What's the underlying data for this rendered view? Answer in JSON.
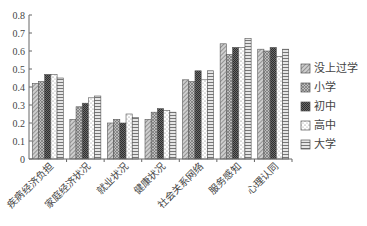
{
  "chart_data": {
    "type": "bar",
    "title": "",
    "xlabel": "",
    "ylabel": "",
    "ylim": [
      0,
      0.8
    ],
    "yticks": [
      "0",
      "0.1",
      "0.2",
      "0.3",
      "0.4",
      "0.5",
      "0.6",
      "0.7",
      "0.8"
    ],
    "grid": false,
    "legend_position": "right",
    "categories": [
      "疾病经济负担",
      "家庭经济状况",
      "就业状况",
      "健康状况",
      "社会关系网络",
      "服务感知",
      "心理认同"
    ],
    "series": [
      {
        "name": "没上过学",
        "pattern": "diag-light",
        "values": [
          0.42,
          0.22,
          0.2,
          0.22,
          0.44,
          0.64,
          0.61
        ]
      },
      {
        "name": "小学",
        "pattern": "diag-cross",
        "values": [
          0.43,
          0.29,
          0.22,
          0.26,
          0.43,
          0.58,
          0.6
        ]
      },
      {
        "name": "初中",
        "pattern": "dark-check",
        "values": [
          0.47,
          0.31,
          0.2,
          0.28,
          0.49,
          0.62,
          0.62
        ]
      },
      {
        "name": "高中",
        "pattern": "dots",
        "values": [
          0.47,
          0.34,
          0.25,
          0.27,
          0.44,
          0.62,
          0.57
        ]
      },
      {
        "name": "大学",
        "pattern": "horizontal",
        "values": [
          0.45,
          0.35,
          0.23,
          0.26,
          0.49,
          0.67,
          0.61
        ]
      }
    ]
  }
}
